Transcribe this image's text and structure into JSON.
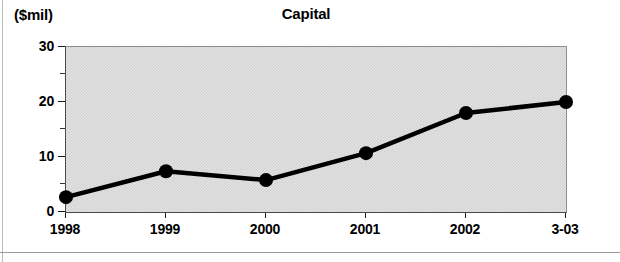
{
  "figure": {
    "unit_label": "($mil)",
    "title": "Capital"
  },
  "chart_data": {
    "type": "line",
    "title": "Capital",
    "subtitle": "",
    "xlabel": "",
    "ylabel": "($mil)",
    "categories": [
      "1998",
      "1999",
      "2000",
      "2001",
      "2002",
      "3-03"
    ],
    "values": [
      2.7,
      7.4,
      5.8,
      10.7,
      18.0,
      20.0
    ],
    "ylim": [
      0,
      30
    ],
    "yticks": [
      "0",
      "10",
      "20",
      "30"
    ],
    "yticks_values": [
      0,
      10,
      20,
      30
    ],
    "yminor_values": [
      5,
      15,
      25
    ],
    "grid": false,
    "legend": "none",
    "marker": "filled-circle",
    "line_color": "#000000",
    "plot_background": "#e3e3e3"
  },
  "axes": {
    "y_labels": [
      "30",
      "20",
      "10",
      "0"
    ],
    "x_labels": [
      "1998",
      "1999",
      "2000",
      "2001",
      "2002",
      "3-03"
    ]
  }
}
